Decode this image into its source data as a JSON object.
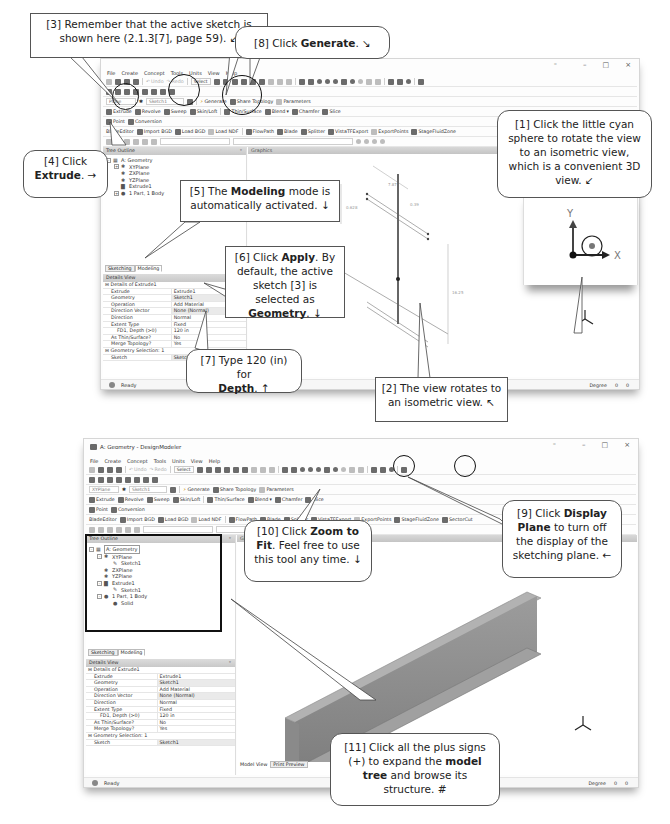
{
  "top_window": {
    "menu": [
      "File",
      "Create",
      "Concept",
      "Tools",
      "Units",
      "View",
      "Help"
    ],
    "toolbar": {
      "undo": "Undo",
      "redo": "Redo",
      "select": "Select",
      "plane_combo": "Plane",
      "sketch_combo": "Sketch1",
      "generate": "Generate",
      "share_topology": "Share Topology",
      "parameters": "Parameters",
      "extrude": "Extrude",
      "revolve": "Revolve",
      "sweep": "Sweep",
      "skin_loft": "Skin/Loft",
      "thin_surface": "Thin/Surface",
      "blend": "Blend",
      "chamfer": "Chamfer",
      "slice": "Slice",
      "point": "Point",
      "conversion": "Conversion",
      "blade_editor": "BladeEditor",
      "import_bgd": "Import BGD",
      "load_bgd": "Load BGD",
      "load_ndf": "Load NDF",
      "flowpath": "FlowPath",
      "blade": "Blade",
      "splitter": "Splitter",
      "vista_tf_export": "VistaTFExport",
      "export_points": "ExportPoints",
      "stage_fluid_zone": "StageFluidZone"
    },
    "tree_outline": {
      "title": "Tree Outline",
      "items": [
        {
          "label": "A: Geometry",
          "level": 0,
          "expander": "-"
        },
        {
          "label": "XYPlane",
          "level": 1,
          "expander": "+"
        },
        {
          "label": "ZXPlane",
          "level": 1,
          "expander": ""
        },
        {
          "label": "YZPlane",
          "level": 1,
          "expander": ""
        },
        {
          "label": "Extrude1",
          "level": 1,
          "expander": ""
        },
        {
          "label": "1 Part, 1 Body",
          "level": 1,
          "expander": "+"
        }
      ]
    },
    "tabs": [
      "Sketching",
      "Modeling"
    ],
    "graphics_title": "Graphics",
    "dimensions": [
      "7.87",
      "0.39",
      "0.628",
      "16.25"
    ],
    "details_view": {
      "title": "Details View",
      "group": "Details of Extrude1",
      "rows": [
        {
          "k": "Extrude",
          "v": "Extrude1"
        },
        {
          "k": "Geometry",
          "v": "Sketch1",
          "hl": true
        },
        {
          "k": "Operation",
          "v": "Add Material"
        },
        {
          "k": "Direction Vector",
          "v": "None (Normal)",
          "hl": true
        },
        {
          "k": "Direction",
          "v": "Normal"
        },
        {
          "k": "Extent Type",
          "v": "Fixed"
        },
        {
          "k": "FD1, Depth (>0)",
          "v": "120 in",
          "indent": true
        },
        {
          "k": "As Thin/Surface?",
          "v": "No"
        },
        {
          "k": "Merge Topology?",
          "v": "Yes"
        }
      ],
      "group2": "Geometry Selection: 1",
      "rows2": [
        {
          "k": "Sketch",
          "v": "Sketch1",
          "hl": true
        }
      ]
    },
    "status": "Ready",
    "status_right": {
      "unit": "Degree",
      "v1": "0",
      "v2": "0"
    },
    "triad_labels": {
      "y": "Y",
      "x": "X",
      "z": "Z"
    }
  },
  "bottom_window": {
    "title": "A: Geometry - DesignModeler",
    "menu": [
      "File",
      "Create",
      "Concept",
      "Tools",
      "Units",
      "View",
      "Help"
    ],
    "toolbar": {
      "undo": "Undo",
      "redo": "Redo",
      "select": "Select",
      "plane_combo": "XYPlane",
      "sketch_combo": "Sketch1",
      "generate": "Generate",
      "share_topology": "Share Topology",
      "parameters": "Parameters",
      "extrude": "Extrude",
      "revolve": "Revolve",
      "sweep": "Sweep",
      "skin_loft": "Skin/Loft",
      "thin_surface": "Thin/Surface",
      "blend": "Blend",
      "chamfer": "Chamfer",
      "slice": "Slice",
      "point": "Point",
      "conversion": "Conversion",
      "blade_editor": "BladeEditor",
      "import_bgd": "Import BGD",
      "load_bgd": "Load BGD",
      "load_ndf": "Load NDF",
      "flowpath": "FlowPath",
      "blade": "Blade",
      "splitter": "Splitter",
      "vista_tf_export": "VistaTFExport",
      "export_points": "ExportPoints",
      "stage_fluid_zone": "StageFluidZone",
      "sector_cut": "SectorCut"
    },
    "tree_outline": {
      "title": "Tree Outline",
      "items": [
        {
          "label": "A: Geometry",
          "level": 0,
          "expander": "-"
        },
        {
          "label": "XYPlane",
          "level": 1,
          "expander": "-"
        },
        {
          "label": "Sketch1",
          "level": 2,
          "expander": ""
        },
        {
          "label": "ZXPlane",
          "level": 1,
          "expander": ""
        },
        {
          "label": "YZPlane",
          "level": 1,
          "expander": ""
        },
        {
          "label": "Extrude1",
          "level": 1,
          "expander": "-"
        },
        {
          "label": "Sketch1",
          "level": 2,
          "expander": ""
        },
        {
          "label": "1 Part, 1 Body",
          "level": 1,
          "expander": "-"
        },
        {
          "label": "Solid",
          "level": 2,
          "expander": ""
        }
      ]
    },
    "tabs": [
      "Sketching",
      "Modeling"
    ],
    "graphics_title": "Graphics",
    "view_tabs": [
      "Model View",
      "Print Preview"
    ],
    "details_view": {
      "title": "Details View",
      "group": "Details of Extrude1",
      "rows": [
        {
          "k": "Extrude",
          "v": "Extrude1"
        },
        {
          "k": "Geometry",
          "v": "Sketch1",
          "hl": true
        },
        {
          "k": "Operation",
          "v": "Add Material"
        },
        {
          "k": "Direction Vector",
          "v": "None (Normal)",
          "hl": true
        },
        {
          "k": "Direction",
          "v": "Normal"
        },
        {
          "k": "Extent Type",
          "v": "Fixed"
        },
        {
          "k": "FD1, Depth (>0)",
          "v": "120 in",
          "indent": true
        },
        {
          "k": "As Thin/Surface?",
          "v": "No"
        },
        {
          "k": "Merge Topology?",
          "v": "Yes"
        }
      ],
      "group2": "Geometry Selection: 1",
      "rows2": [
        {
          "k": "Sketch",
          "v": "Sketch1",
          "hl": true
        }
      ]
    },
    "status": "Ready",
    "status_right": {
      "unit": "Degree",
      "v1": "0",
      "v2": "0"
    },
    "triad_labels": {
      "y": "Y",
      "x": "X",
      "z": "Z"
    }
  },
  "inset": {
    "y": "Y",
    "x": "X"
  },
  "callouts": {
    "c1": {
      "pre": "[1] Click the little cyan sphere to rotate the view to an isometric view, which is a convenient 3D view.",
      "arrow": "↙"
    },
    "c2": {
      "pre": "[2] The view rotates to an isometric view.",
      "arrow": "↖"
    },
    "c3": {
      "pre": "[3] Remember that the active sketch is shown here (2.1.3[7], page 59).",
      "arrow": "↙"
    },
    "c4": {
      "pre": "[4] Click",
      "bold": "Extrude",
      "post": ".",
      "arrow": "→"
    },
    "c5": {
      "pre": "[5] The",
      "bold": "Modeling",
      "post": "mode is automatically activated.",
      "arrow": "↓"
    },
    "c6": {
      "pre": "[6] Click",
      "bold": "Apply",
      "mid": ". By default, the active sketch [3] is selected as",
      "bold2": "Geometry",
      "post": ".",
      "arrow": "↓"
    },
    "c7": {
      "pre": "[7] Type 120 (in) for",
      "bold": "Depth",
      "post": ".",
      "arrow": "↑"
    },
    "c8": {
      "pre": "[8] Click",
      "bold": "Generate",
      "post": ".",
      "arrow": "↘"
    },
    "c9": {
      "pre": "[9] Click",
      "bold": "Display Plane",
      "post": "to turn off the display of the sketching plane.",
      "arrow": "←"
    },
    "c10": {
      "pre": "[10] Click",
      "bold": "Zoom to Fit",
      "post": ". Feel free to use this tool any time.",
      "arrow": "↓"
    },
    "c11": {
      "pre": "[11] Click all the plus signs (+) to expand the",
      "bold": "model tree",
      "post": "and browse its structure.",
      "arrow": "#"
    }
  }
}
